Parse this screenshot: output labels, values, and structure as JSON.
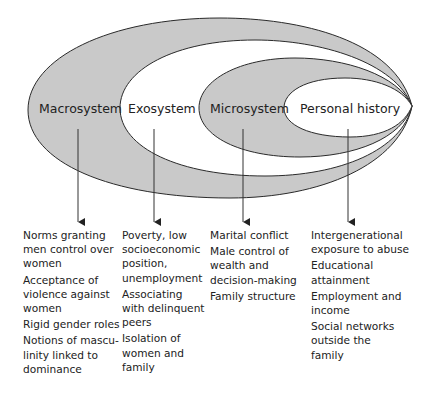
{
  "diagram": {
    "type": "nested ecological model",
    "colors": {
      "shaded": "#c9c9c9",
      "unshaded": "#ffffff",
      "stroke": "#2a2a2a"
    },
    "levels": [
      {
        "id": "macrosystem",
        "label": "Macrosystem",
        "shaded": true
      },
      {
        "id": "exosystem",
        "label": "Exosystem",
        "shaded": false
      },
      {
        "id": "microsystem",
        "label": "Microsystem",
        "shaded": true
      },
      {
        "id": "personal_history",
        "label": "Personal history",
        "shaded": false
      }
    ]
  },
  "columns": [
    {
      "level": "Macrosystem",
      "items": [
        [
          "Norms granting",
          "men control over",
          "women"
        ],
        [
          "Acceptance of",
          "violence against",
          "women"
        ],
        [
          "Rigid gender roles"
        ],
        [
          "Notions of mascu-",
          "linity linked to",
          "dominance"
        ]
      ]
    },
    {
      "level": "Exosystem",
      "items": [
        [
          "Poverty, low",
          "socioeconomic",
          "position,",
          "unemployment"
        ],
        [
          "Associating",
          "with delinquent",
          "peers"
        ],
        [
          "Isolation of",
          "women and",
          "family"
        ]
      ]
    },
    {
      "level": "Microsystem",
      "items": [
        [
          "Marital conflict"
        ],
        [
          "Male control of",
          "wealth and",
          "decision-making"
        ],
        [
          "Family structure"
        ]
      ]
    },
    {
      "level": "Personal history",
      "items": [
        [
          "Intergenerational",
          "exposure to abuse"
        ],
        [
          "Educational",
          "attainment"
        ],
        [
          "Employment and",
          "income"
        ],
        [
          "Social networks",
          "outside the",
          "family"
        ]
      ]
    }
  ]
}
